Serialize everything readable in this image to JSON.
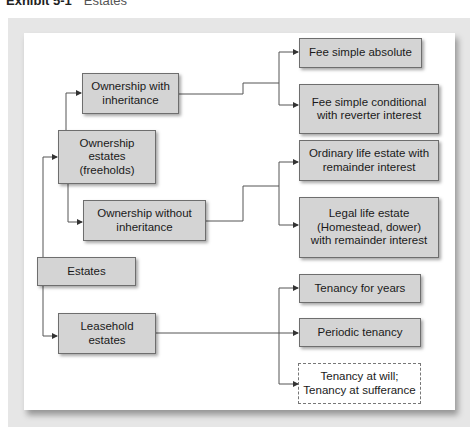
{
  "title": {
    "exhibit": "Exhibit 5-1",
    "name": "Estates"
  },
  "nodes": {
    "estates": "Estates",
    "ownership_estates": "Ownership estates (freeholds)",
    "ownership_with_inheritance": "Ownership with inheritance",
    "ownership_without_inheritance": "Ownership without inheritance",
    "leasehold_estates": "Leasehold estates",
    "fee_simple_absolute": "Fee simple absolute",
    "fee_simple_conditional": "Fee simple conditional with reverter interest",
    "ordinary_life_estate": "Ordinary life estate with remainder interest",
    "legal_life_estate": "Legal life estate (Homestead, dower) with remainder interest",
    "tenancy_for_years": "Tenancy for years",
    "periodic_tenancy": "Periodic tenancy",
    "tenancy_at_will": "Tenancy at will; Tenancy at sufferance"
  },
  "colors": {
    "box_fill": "#d4d4d4",
    "box_border": "#6e6e6e",
    "frame": "#e6e6e6",
    "line": "#555555"
  }
}
